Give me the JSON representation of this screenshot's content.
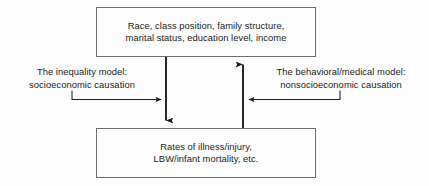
{
  "diagram": {
    "type": "flow-diagram",
    "background_color": "#fdfdfd",
    "stroke_color": "#1c1c1c",
    "box_border_color": "#6b6b70",
    "nodes": {
      "factors_box": {
        "line1": "Race, class position, family structure,",
        "line2": "marital status, education level, income"
      },
      "outcomes_box": {
        "line1": "Rates of illness/injury,",
        "line2": "LBW/infant mortality, etc."
      }
    },
    "labels": {
      "inequality_model": {
        "line1": "The inequality model:",
        "line2": "socioeconomic causation"
      },
      "behavioral_model": {
        "line1": "The behavioral/medical model:",
        "line2": "nonsocioeconomic causation"
      }
    },
    "arrows": {
      "downward_arrow": "down-arrow-factors-to-outcomes",
      "upward_arrow": "up-arrow-outcomes-to-factors",
      "left_connector": "elbow-arrow-inequality-label-to-down-arrow",
      "right_connector": "elbow-arrow-behavioral-label-to-up-arrow"
    }
  }
}
